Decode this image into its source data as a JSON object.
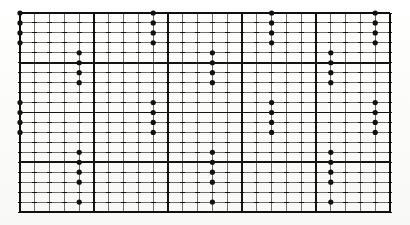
{
  "figure": {
    "kind": "dot-matrix-grid-chart",
    "title": "",
    "background_color": "#fdfdfc",
    "ink_color": "#1a1a1a"
  },
  "grid": {
    "origin_x": 20,
    "origin_y": 13,
    "cols": 25,
    "rows": 20,
    "cell_width": 14.8,
    "cell_height": 9.95,
    "major_every_col": 5,
    "major_every_row": 5,
    "minor_line_width": 0.8,
    "major_line_width": 1.9,
    "border_line_width": 2.2,
    "minor_line_color": "#4a4a4a",
    "major_line_color": "#141414",
    "border_line_color": "#101010",
    "tick_marks": true,
    "tick_color": "#111111",
    "tick_size": 2.4
  },
  "chart_data": {
    "type": "scatter",
    "title": "",
    "xlabel": "",
    "ylabel": "",
    "xlim": [
      0,
      25
    ],
    "ylim": [
      0,
      20
    ],
    "grid": true,
    "legend": "none",
    "marker": "filled-circle",
    "marker_radius": 2.6,
    "marker_color": "#111111",
    "note": "Dots sit on grid intersections; coordinates are column,row indices from the top-left origin of the ruled grid.",
    "points": [
      {
        "col": 0,
        "row": 0
      },
      {
        "col": 0,
        "row": 1
      },
      {
        "col": 0,
        "row": 2
      },
      {
        "col": 0,
        "row": 3
      },
      {
        "col": 4,
        "row": 4
      },
      {
        "col": 4,
        "row": 5
      },
      {
        "col": 4,
        "row": 6
      },
      {
        "col": 4,
        "row": 7
      },
      {
        "col": 0,
        "row": 9
      },
      {
        "col": 0,
        "row": 10
      },
      {
        "col": 0,
        "row": 11
      },
      {
        "col": 0,
        "row": 12
      },
      {
        "col": 4,
        "row": 14
      },
      {
        "col": 4,
        "row": 15
      },
      {
        "col": 4,
        "row": 16
      },
      {
        "col": 4,
        "row": 17
      },
      {
        "col": 4,
        "row": 19
      },
      {
        "col": 9,
        "row": 0
      },
      {
        "col": 9,
        "row": 1
      },
      {
        "col": 9,
        "row": 2
      },
      {
        "col": 9,
        "row": 3
      },
      {
        "col": 13,
        "row": 4
      },
      {
        "col": 13,
        "row": 5
      },
      {
        "col": 13,
        "row": 6
      },
      {
        "col": 13,
        "row": 7
      },
      {
        "col": 9,
        "row": 9
      },
      {
        "col": 9,
        "row": 10
      },
      {
        "col": 9,
        "row": 11
      },
      {
        "col": 9,
        "row": 12
      },
      {
        "col": 13,
        "row": 14
      },
      {
        "col": 13,
        "row": 15
      },
      {
        "col": 13,
        "row": 16
      },
      {
        "col": 13,
        "row": 17
      },
      {
        "col": 13,
        "row": 19
      },
      {
        "col": 17,
        "row": 0
      },
      {
        "col": 17,
        "row": 1
      },
      {
        "col": 17,
        "row": 2
      },
      {
        "col": 17,
        "row": 3
      },
      {
        "col": 21,
        "row": 4
      },
      {
        "col": 21,
        "row": 5
      },
      {
        "col": 21,
        "row": 6
      },
      {
        "col": 21,
        "row": 7
      },
      {
        "col": 17,
        "row": 9
      },
      {
        "col": 17,
        "row": 10
      },
      {
        "col": 17,
        "row": 11
      },
      {
        "col": 17,
        "row": 12
      },
      {
        "col": 21,
        "row": 14
      },
      {
        "col": 21,
        "row": 15
      },
      {
        "col": 21,
        "row": 16
      },
      {
        "col": 21,
        "row": 17
      },
      {
        "col": 21,
        "row": 19
      },
      {
        "col": 24,
        "row": 0
      },
      {
        "col": 24,
        "row": 1
      },
      {
        "col": 24,
        "row": 2
      },
      {
        "col": 24,
        "row": 3
      },
      {
        "col": 28,
        "row": 4
      },
      {
        "col": 28,
        "row": 5
      },
      {
        "col": 28,
        "row": 6
      },
      {
        "col": 28,
        "row": 7
      },
      {
        "col": 24,
        "row": 9
      },
      {
        "col": 24,
        "row": 10
      },
      {
        "col": 24,
        "row": 11
      },
      {
        "col": 24,
        "row": 12
      },
      {
        "col": 28,
        "row": 14
      },
      {
        "col": 28,
        "row": 15
      },
      {
        "col": 28,
        "row": 16
      },
      {
        "col": 28,
        "row": 17
      },
      {
        "col": 28,
        "row": 19
      }
    ]
  }
}
